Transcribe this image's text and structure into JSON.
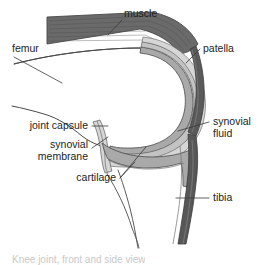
{
  "figure": {
    "background_color": "#ffffff",
    "caption_clipped": "Knee joint, front and side view"
  },
  "colors": {
    "muscle": "#6a6a6a",
    "muscle_stripe": "#4a4a4a",
    "bone_fill": "#ffffff",
    "cartilage": "#a9a9a9",
    "synovial_fluid": "#c3c3c3",
    "synovial_membrane": "#d6d6d6",
    "patella": "#5a5a5a",
    "tibia": "#575757",
    "outline": "#4a4a4a",
    "leader": "#3a3a3a",
    "text": "#1d1d1d"
  },
  "labels": [
    {
      "id": "muscle",
      "text": "muscle",
      "x": 124,
      "y": 17,
      "anchor": "start"
    },
    {
      "id": "femur",
      "text": "femur",
      "x": 12,
      "y": 52,
      "anchor": "start"
    },
    {
      "id": "patella",
      "text": "patella",
      "x": 203,
      "y": 52,
      "anchor": "start"
    },
    {
      "id": "joint-capsule",
      "text": "joint capsule",
      "x": 88,
      "y": 129,
      "anchor": "end"
    },
    {
      "id": "synovial-membrane-1",
      "text": "synovial",
      "x": 88,
      "y": 148,
      "anchor": "end"
    },
    {
      "id": "synovial-membrane-2",
      "text": "membrane",
      "x": 88,
      "y": 160,
      "anchor": "end"
    },
    {
      "id": "cartilage",
      "text": "cartilage",
      "x": 116,
      "y": 181,
      "anchor": "end"
    },
    {
      "id": "synovial-fluid-1",
      "text": "synovial",
      "x": 213,
      "y": 125,
      "anchor": "start"
    },
    {
      "id": "synovial-fluid-2",
      "text": "fluid",
      "x": 213,
      "y": 137,
      "anchor": "start"
    },
    {
      "id": "tibia",
      "text": "tibia",
      "x": 213,
      "y": 201,
      "anchor": "start"
    }
  ],
  "structures": [
    {
      "id": "muscle",
      "name": "quadriceps muscle"
    },
    {
      "id": "femur",
      "name": "femur bone"
    },
    {
      "id": "patella",
      "name": "patella bone"
    },
    {
      "id": "tibia",
      "name": "tibia bone"
    },
    {
      "id": "cartilage",
      "name": "articular cartilage"
    },
    {
      "id": "synovial-fluid",
      "name": "synovial fluid cavity"
    },
    {
      "id": "synovial-membrane",
      "name": "synovial membrane"
    },
    {
      "id": "joint-capsule",
      "name": "joint capsule"
    }
  ]
}
